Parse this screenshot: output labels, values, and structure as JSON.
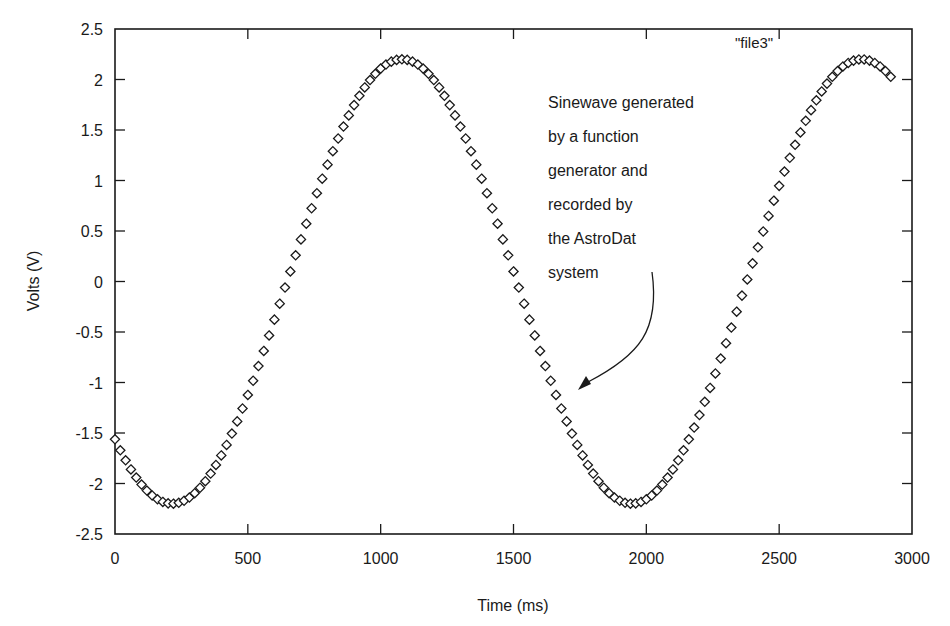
{
  "chart_data": {
    "type": "scatter",
    "title": "",
    "xlabel": "Time (ms)",
    "ylabel": "Volts (V)",
    "xlim": [
      0,
      3000
    ],
    "ylim": [
      -2.5,
      2.5
    ],
    "grid": false,
    "legend_position": "top-right",
    "x_ticks": [
      "0",
      "500",
      "1000",
      "1500",
      "2000",
      "2500",
      "3000"
    ],
    "y_ticks": [
      "2.5",
      "2",
      "1.5",
      "1",
      "0.5",
      "0",
      "-0.5",
      "-1",
      "-1.5",
      "-2",
      "-2.5"
    ],
    "marker": "diamond",
    "series": [
      {
        "name": "\"file3\"",
        "model": {
          "form": "amplitude * sin(2*pi*(t - phase_ms)/period_ms)",
          "amplitude": 2.2,
          "period_ms": 1730,
          "phase_ms": 647.5,
          "t_start": 0,
          "t_end": 2920,
          "t_step": 20
        },
        "key_points": [
          {
            "x": 0,
            "y": -1.55
          },
          {
            "x": 230,
            "y": -2.2
          },
          {
            "x": 650,
            "y": 0.0
          },
          {
            "x": 1080,
            "y": 2.2
          },
          {
            "x": 1510,
            "y": 0.0
          },
          {
            "x": 1950,
            "y": -2.2
          },
          {
            "x": 2380,
            "y": 0.0
          },
          {
            "x": 2810,
            "y": 2.2
          },
          {
            "x": 2920,
            "y": 2.05
          }
        ]
      }
    ],
    "annotations": [
      {
        "lines": [
          "Sinewave generated",
          "by a function",
          "generator and",
          "recorded by",
          "the AstroDat",
          "system"
        ],
        "arrow_to": {
          "x": 1060,
          "y": -1.1
        }
      }
    ]
  },
  "labels": {
    "xlabel": "Time (ms)",
    "ylabel": "Volts (V)",
    "legend": "\"file3\"",
    "annotation_lines": [
      "Sinewave generated",
      "by a function",
      "generator and",
      "recorded by",
      "the AstroDat",
      "system"
    ]
  }
}
